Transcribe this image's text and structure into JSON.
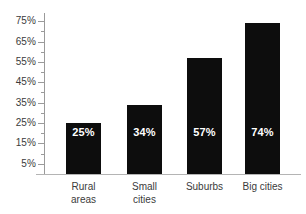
{
  "chart_data": {
    "type": "bar",
    "title": "",
    "subtitle": "",
    "xlabel": "",
    "ylabel": "",
    "categories": [
      "Rural areas",
      "Small cities",
      "Suburbs",
      "Big cities"
    ],
    "category_lines": [
      [
        "Rural",
        "areas"
      ],
      [
        "Small",
        "cities"
      ],
      [
        "Suburbs",
        ""
      ],
      [
        "Big cities",
        ""
      ]
    ],
    "values": [
      25,
      34,
      57,
      74
    ],
    "value_labels": [
      "25%",
      "34%",
      "57%",
      "74%"
    ],
    "ylim": [
      0,
      79
    ],
    "ytick_values": [
      5,
      15,
      25,
      35,
      45,
      55,
      65,
      75
    ],
    "ytick_labels": [
      "5%",
      "15%",
      "25%",
      "35%",
      "45%",
      "55%",
      "65%",
      "75%"
    ],
    "yminor_values": [
      10,
      20,
      30,
      40,
      50,
      60,
      70
    ],
    "grid": false,
    "legend": false,
    "legend_position": "none",
    "bar_color": "#0d0d0d",
    "value_label_color": "#ffffff",
    "axis_color": "#9a9a9a",
    "tick_label_color": "#3b3b3b",
    "background": "#ffffff"
  }
}
